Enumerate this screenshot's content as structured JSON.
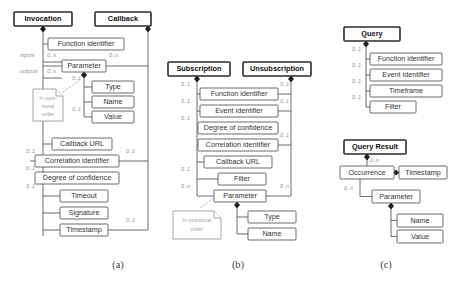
{
  "figure": {
    "captions": [
      {
        "id": "caption-a",
        "label": "(a)",
        "x": 118,
        "y": 268
      },
      {
        "id": "caption-b",
        "label": "(b)",
        "x": 238,
        "y": 268
      },
      {
        "id": "caption-c",
        "label": "(c)",
        "x": 386,
        "y": 268
      }
    ]
  },
  "panel_a": {
    "classes": [
      {
        "name": "Invocation",
        "x": 14,
        "y": 12,
        "w": 58,
        "h": 14
      },
      {
        "name": "Callback",
        "x": 95,
        "y": 12,
        "w": 56,
        "h": 14
      }
    ],
    "attributes": [
      {
        "name": "Function identifier",
        "x": 48,
        "y": 38,
        "w": 76,
        "h": 12
      },
      {
        "name": "Parameter",
        "x": 62,
        "y": 60,
        "w": 44,
        "h": 12
      },
      {
        "name": "Type",
        "x": 92,
        "y": 81,
        "w": 42,
        "h": 12
      },
      {
        "name": "Name",
        "x": 92,
        "y": 96,
        "w": 42,
        "h": 12
      },
      {
        "name": "Value",
        "x": 92,
        "y": 111,
        "w": 42,
        "h": 12
      },
      {
        "name": "Callback URL",
        "x": 52,
        "y": 138,
        "w": 60,
        "h": 12
      },
      {
        "name": "Correlation identifier",
        "x": 35,
        "y": 155,
        "w": 84,
        "h": 12
      },
      {
        "name": "Degree of confidence",
        "x": 35,
        "y": 172,
        "w": 84,
        "h": 12
      },
      {
        "name": "Timeout",
        "x": 60,
        "y": 190,
        "w": 48,
        "h": 12
      },
      {
        "name": "Signature",
        "x": 60,
        "y": 207,
        "w": 48,
        "h": 12
      },
      {
        "name": "Timestamp",
        "x": 60,
        "y": 224,
        "w": 48,
        "h": 12
      }
    ],
    "roles": [
      {
        "text": "inputs",
        "x": 20,
        "y": 57
      },
      {
        "text": "outputs",
        "x": 20,
        "y": 73
      }
    ],
    "multiplicities": [
      {
        "text": "0..n",
        "x": 47,
        "y": 57
      },
      {
        "text": "0..n",
        "x": 47,
        "y": 73
      },
      {
        "text": "0..n",
        "x": 109,
        "y": 57
      },
      {
        "text": "0..1",
        "x": 72,
        "y": 77
      },
      {
        "text": "0..1",
        "x": 72,
        "y": 108
      },
      {
        "text": "0..1",
        "x": 30,
        "y": 152
      },
      {
        "text": "0..1",
        "x": 30,
        "y": 169
      },
      {
        "text": "0..1",
        "x": 30,
        "y": 186
      },
      {
        "text": "0..1",
        "x": 128,
        "y": 152
      },
      {
        "text": "0..1",
        "x": 128,
        "y": 221
      }
    ],
    "note": {
      "text_line1": "In posi-",
      "text_line2": "tional",
      "text_line3": "order",
      "x": 33,
      "y": 89,
      "w": 30,
      "h": 32
    }
  },
  "panel_b": {
    "classes": [
      {
        "name": "Subscription",
        "x": 168,
        "y": 62,
        "w": 62,
        "h": 14
      },
      {
        "name": "Unsubscription",
        "x": 243,
        "y": 62,
        "w": 68,
        "h": 14
      }
    ],
    "attributes": [
      {
        "name": "Function identifier",
        "x": 200,
        "y": 88,
        "w": 78,
        "h": 12
      },
      {
        "name": "Event identifier",
        "x": 200,
        "y": 105,
        "w": 78,
        "h": 12
      },
      {
        "name": "Degree of confidence",
        "x": 198,
        "y": 122,
        "w": 80,
        "h": 12
      },
      {
        "name": "Correlation identifier",
        "x": 198,
        "y": 139,
        "w": 80,
        "h": 12
      },
      {
        "name": "Callback URL",
        "x": 204,
        "y": 156,
        "w": 68,
        "h": 12
      },
      {
        "name": "Filter",
        "x": 218,
        "y": 173,
        "w": 48,
        "h": 12
      },
      {
        "name": "Parameter",
        "x": 214,
        "y": 190,
        "w": 52,
        "h": 12
      },
      {
        "name": "Type",
        "x": 248,
        "y": 211,
        "w": 48,
        "h": 12
      },
      {
        "name": "Name",
        "x": 248,
        "y": 228,
        "w": 48,
        "h": 12
      }
    ],
    "multiplicities": [
      {
        "text": "0..1",
        "x": 183,
        "y": 85
      },
      {
        "text": "0..1",
        "x": 183,
        "y": 102
      },
      {
        "text": "0..1",
        "x": 183,
        "y": 119
      },
      {
        "text": "0..1",
        "x": 183,
        "y": 170
      },
      {
        "text": "0..n",
        "x": 183,
        "y": 187
      },
      {
        "text": "0..1",
        "x": 285,
        "y": 85
      },
      {
        "text": "0..1",
        "x": 285,
        "y": 102
      },
      {
        "text": "0..1",
        "x": 285,
        "y": 136
      },
      {
        "text": "0..n",
        "x": 285,
        "y": 187
      }
    ],
    "note": {
      "text_line1": "In positional",
      "text_line2": "order",
      "x": 173,
      "y": 211,
      "w": 48,
      "h": 28
    }
  },
  "panel_c": {
    "classes": [
      {
        "name": "Query",
        "x": 344,
        "y": 27,
        "w": 56,
        "h": 14
      },
      {
        "name": "Query Result",
        "x": 344,
        "y": 140,
        "w": 62,
        "h": 14
      }
    ],
    "attributes": [
      {
        "name": "Function identifier",
        "x": 370,
        "y": 53,
        "w": 72,
        "h": 12
      },
      {
        "name": "Event identifier",
        "x": 370,
        "y": 69,
        "w": 72,
        "h": 12
      },
      {
        "name": "Timeframe",
        "x": 370,
        "y": 85,
        "w": 72,
        "h": 12
      },
      {
        "name": "Filter",
        "x": 370,
        "y": 101,
        "w": 46,
        "h": 12
      },
      {
        "name": "Occurrence",
        "x": 340,
        "y": 166,
        "w": 54,
        "h": 13
      },
      {
        "name": "Timestamp",
        "x": 399,
        "y": 166,
        "w": 48,
        "h": 13
      },
      {
        "name": "Parameter",
        "x": 372,
        "y": 190,
        "w": 48,
        "h": 13
      },
      {
        "name": "Name",
        "x": 397,
        "y": 214,
        "w": 46,
        "h": 13
      },
      {
        "name": "Value",
        "x": 397,
        "y": 230,
        "w": 46,
        "h": 13
      }
    ],
    "multiplicities": [
      {
        "text": "0..1",
        "x": 356,
        "y": 50
      },
      {
        "text": "0..1",
        "x": 356,
        "y": 66
      },
      {
        "text": "0..1",
        "x": 356,
        "y": 82
      },
      {
        "text": "0..1",
        "x": 356,
        "y": 98
      },
      {
        "text": "0..n",
        "x": 370,
        "y": 160
      },
      {
        "text": "0..n",
        "x": 349,
        "y": 188
      }
    ]
  },
  "colors": {
    "class_border": "#2b2b2b",
    "attr_border": "#5a5a5a",
    "edge": "#5a5a5a",
    "mult_text": "#8e8e8e",
    "note_text": "#a6a6a6",
    "background": "#ffffff"
  }
}
